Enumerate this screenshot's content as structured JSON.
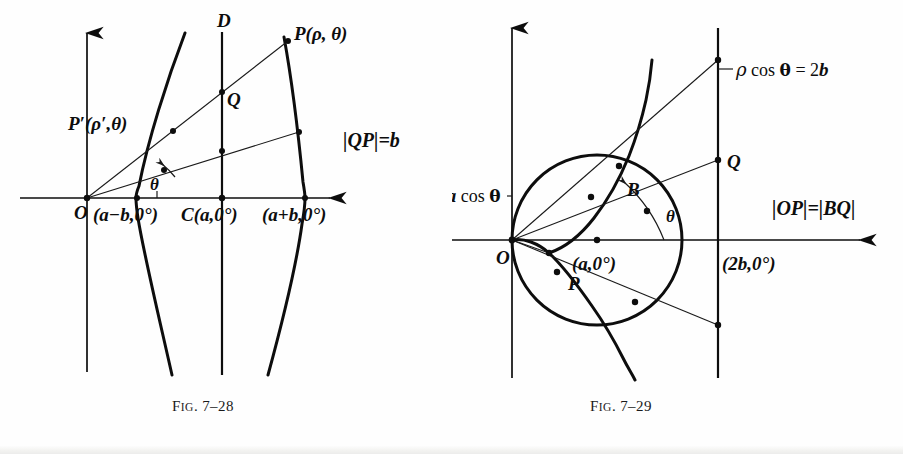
{
  "page": {
    "background_color": "#fefefe",
    "ink_color": "#0d0d0d"
  },
  "figures": [
    {
      "id": "fig-7-28",
      "caption_prefix": "F",
      "caption_smallcaps": "IG",
      "caption_number": ". 7–28",
      "caption_full": "Fig. 7–28",
      "description": "Conchoid of Nicomedes construction about directrix D",
      "labels": {
        "origin": "O",
        "directrix": "D",
        "point_p": "P(ρ, θ)",
        "point_p_prime": "P′(ρ′,θ)",
        "point_q": "Q",
        "angle": "θ",
        "relation": "|QP|=b",
        "inner_intercept": "(a−b,0°)",
        "center_intercept": "C(a,0°)",
        "outer_intercept": "(a+b,0°)"
      }
    },
    {
      "id": "fig-7-29",
      "caption_prefix": "F",
      "caption_smallcaps": "IG",
      "caption_number": ". 7–29",
      "caption_full": "Fig. 7–29",
      "description": "Cissoid-type construction from circle ρ=2a cos θ and line ρ cos θ = 2b",
      "labels": {
        "origin": "O",
        "circle_equation": "ρ=2a cos θ",
        "line_equation": "ρ cos θ = 2b",
        "point_p": "P",
        "point_b": "B",
        "point_q": "Q",
        "angle": "θ",
        "relation": "|OP|=|BQ|",
        "circle_center": "(a,0°)",
        "line_intercept": "(2b,0°)"
      }
    }
  ]
}
